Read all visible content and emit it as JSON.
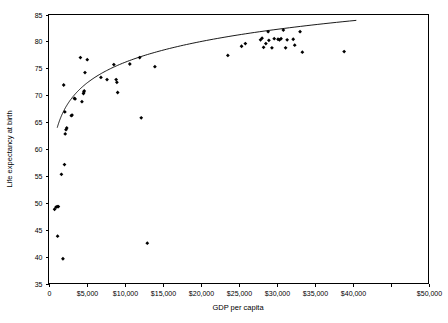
{
  "chart_data": {
    "type": "scatter",
    "title": "",
    "xlabel": "GDP per capita",
    "ylabel": "Life expectancy at birth",
    "xlim": [
      0,
      50000
    ],
    "ylim": [
      35,
      85
    ],
    "grid": false,
    "legend": null,
    "xticks": [
      0,
      5000,
      10000,
      15000,
      20000,
      25000,
      30000,
      35000,
      40000,
      45000,
      50000
    ],
    "xticklabels": [
      "0",
      "$5,000",
      "$10,000",
      "$15,000",
      "$20,000",
      "$25,000",
      "$30,000",
      "$35,000",
      "$40,000",
      "",
      "$50,000"
    ],
    "yticks": [
      35,
      40,
      45,
      50,
      55,
      60,
      65,
      70,
      75,
      80,
      85
    ],
    "yticklabels": [
      "35",
      "40",
      "45",
      "50",
      "55",
      "60",
      "65",
      "70",
      "75",
      "80",
      "85"
    ],
    "marker": "filled-diamond",
    "marker_color": "#000000",
    "points": [
      [
        800,
        48.8
      ],
      [
        1000,
        49.2
      ],
      [
        1150,
        49.3
      ],
      [
        1300,
        49.3
      ],
      [
        1200,
        43.8
      ],
      [
        1900,
        39.6
      ],
      [
        1700,
        55.3
      ],
      [
        2100,
        57.1
      ],
      [
        2000,
        71.9
      ],
      [
        2200,
        62.8
      ],
      [
        2300,
        63.6
      ],
      [
        2400,
        63.9
      ],
      [
        2150,
        66.9
      ],
      [
        3000,
        66.2
      ],
      [
        3100,
        66.3
      ],
      [
        3400,
        69.4
      ],
      [
        3500,
        69.3
      ],
      [
        4200,
        77.0
      ],
      [
        4400,
        68.8
      ],
      [
        4600,
        70.3
      ],
      [
        4650,
        70.6
      ],
      [
        4700,
        70.8
      ],
      [
        4800,
        74.2
      ],
      [
        5100,
        76.6
      ],
      [
        6900,
        73.3
      ],
      [
        7700,
        72.9
      ],
      [
        8600,
        75.7
      ],
      [
        8900,
        72.9
      ],
      [
        9000,
        72.4
      ],
      [
        9100,
        70.5
      ],
      [
        10700,
        75.8
      ],
      [
        12200,
        65.8
      ],
      [
        12000,
        77.0
      ],
      [
        13000,
        42.5
      ],
      [
        14000,
        75.3
      ],
      [
        23600,
        77.4
      ],
      [
        25400,
        79.1
      ],
      [
        25900,
        79.6
      ],
      [
        27900,
        80.3
      ],
      [
        28100,
        80.6
      ],
      [
        28300,
        78.9
      ],
      [
        28600,
        79.6
      ],
      [
        28900,
        81.8
      ],
      [
        29000,
        80.2
      ],
      [
        29400,
        78.8
      ],
      [
        29700,
        80.5
      ],
      [
        30200,
        80.4
      ],
      [
        30400,
        80.3
      ],
      [
        30600,
        80.5
      ],
      [
        30900,
        82.1
      ],
      [
        31200,
        78.8
      ],
      [
        31400,
        80.3
      ],
      [
        32200,
        80.4
      ],
      [
        32400,
        79.3
      ],
      [
        33100,
        81.8
      ],
      [
        33400,
        78.0
      ],
      [
        38900,
        78.1
      ]
    ],
    "trend_curve": {
      "description": "logarithmic fit of life expectancy vs GDP per capita",
      "form": "y = a + b * ln(x)",
      "a": 24.5,
      "b": 5.6,
      "x_start": 1150,
      "x_end": 40500
    }
  },
  "caption": {
    "text": ""
  }
}
